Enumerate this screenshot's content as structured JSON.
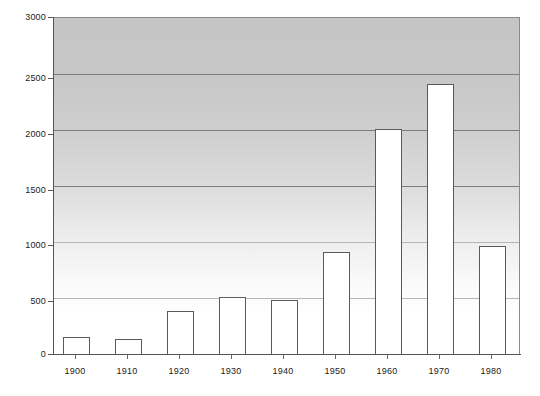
{
  "chart_data": {
    "type": "bar",
    "title": "",
    "subtitle": "",
    "xlabel": "",
    "ylabel": "",
    "categories": [
      "1900",
      "1910",
      "1920",
      "1930",
      "1940",
      "1950",
      "1960",
      "1970",
      "1980"
    ],
    "values": [
      155,
      135,
      385,
      510,
      480,
      915,
      2010,
      2415,
      965
    ],
    "series": [
      {
        "name": "",
        "values": [
          155,
          135,
          385,
          510,
          480,
          915,
          2010,
          2415,
          965
        ]
      }
    ],
    "ylim": [
      0,
      3000
    ],
    "ytick_labels": [
      "0",
      "500",
      "1000",
      "1500",
      "2000",
      "2500",
      "3000"
    ],
    "ytick_values": [
      0,
      500,
      1000,
      1500,
      2000,
      2500,
      3000
    ],
    "xtick_labels": [
      "1900",
      "1910",
      "1920",
      "1930",
      "1940",
      "1950",
      "1960",
      "1970",
      "1980"
    ],
    "grid": true,
    "grid_axis": "y",
    "legend": false,
    "legend_position": "none",
    "bar_fill_color": "#ffffff",
    "bar_edge_color": "#5a5a5a",
    "plot_background_top_color": "#c5c5c5",
    "plot_background_bottom_color": "#ffffff",
    "gridline_color": "#7d7d7d",
    "axis_color": "#555555",
    "text_color": "#1a1a1a"
  }
}
